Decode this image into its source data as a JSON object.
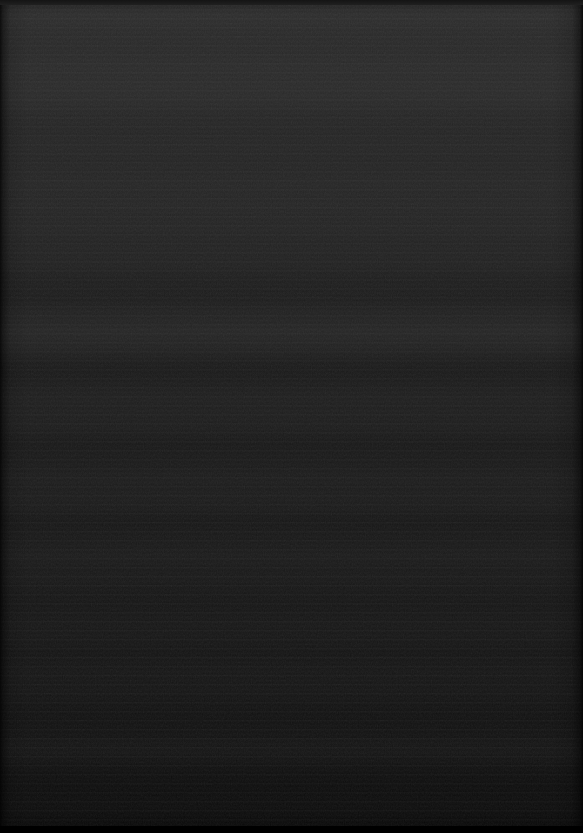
{
  "capture": {
    "width": 583,
    "height": 833,
    "state_label": "",
    "visible_text": [],
    "controls": [],
    "icons": []
  },
  "appearance": {
    "description": "Uniformly dark, effectively black screen capture with no discernible user-interface elements. Only faint horizontal banding and fine sensor/compression grain are present.",
    "dominant_color": "#1a1a1a",
    "top_color": "#2b2b2b",
    "upper_mid_color": "#262626",
    "mid_color": "#1d1d1d",
    "lower_mid_color": "#161616",
    "bottom_color": "#0d0d0d",
    "bottom_strip_color": "#000000",
    "left_edge_color": "#0a0a0a",
    "right_edge_color": "#0b0b0b",
    "texture": "horizontal-banding",
    "noise": "fine-grain"
  },
  "regions": [
    {
      "name": "top-edge-strip",
      "y": 0,
      "height": 5,
      "color": "#181818"
    },
    {
      "name": "upper-band",
      "y": 5,
      "height": 160,
      "color": "#292929"
    },
    {
      "name": "upper-mid-band",
      "y": 165,
      "height": 145,
      "color": "#232323"
    },
    {
      "name": "center-band",
      "y": 310,
      "height": 170,
      "color": "#1c1c1c"
    },
    {
      "name": "lower-mid-band",
      "y": 480,
      "height": 170,
      "color": "#171717"
    },
    {
      "name": "lower-band",
      "y": 650,
      "height": 155,
      "color": "#111111"
    },
    {
      "name": "bottom-edge-strip",
      "y": 826,
      "height": 7,
      "color": "#000000"
    }
  ]
}
